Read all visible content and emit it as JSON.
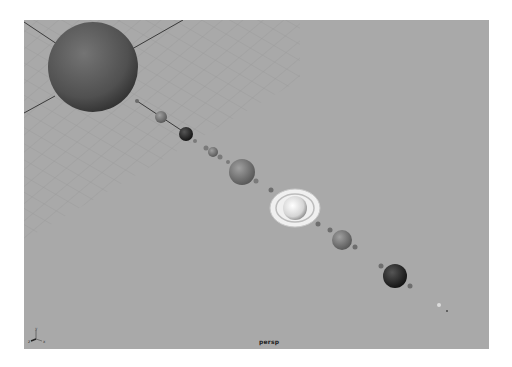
{
  "app": {
    "viewport": {
      "camera_label": "persp",
      "background_color": "#a9a9a9",
      "grid_color": "#8f8f8f",
      "axis_gizmo": {
        "x": "x",
        "y": "y",
        "z": "z"
      }
    }
  },
  "scene": {
    "objects": [
      {
        "name": "sun",
        "cx": 93,
        "cy": 70,
        "r": 45,
        "color": "#5b5b5b"
      },
      {
        "name": "moon-a",
        "cx": 137,
        "cy": 101,
        "r": 2,
        "color": "#6a6a6a"
      },
      {
        "name": "planet-1",
        "cx": 161,
        "cy": 117,
        "r": 6,
        "color": "#6f6f6f"
      },
      {
        "name": "planet-2",
        "cx": 186,
        "cy": 134,
        "r": 7,
        "color": "#1e1e1e"
      },
      {
        "name": "moon-b",
        "cx": 195,
        "cy": 141,
        "r": 2,
        "color": "#7a7a7a"
      },
      {
        "name": "moon-c",
        "cx": 206,
        "cy": 148,
        "r": 2.5,
        "color": "#7a7a7a"
      },
      {
        "name": "planet-3",
        "cx": 213,
        "cy": 152,
        "r": 5,
        "color": "#5e5e5e"
      },
      {
        "name": "moon-d",
        "cx": 220,
        "cy": 157,
        "r": 2.5,
        "color": "#7a7a7a"
      },
      {
        "name": "moon-e",
        "cx": 228,
        "cy": 162,
        "r": 2,
        "color": "#7a7a7a"
      },
      {
        "name": "planet-4",
        "cx": 242,
        "cy": 172,
        "r": 13,
        "color": "#858585"
      },
      {
        "name": "moon-f",
        "cx": 256,
        "cy": 181,
        "r": 2.5,
        "color": "#7a7a7a"
      },
      {
        "name": "moon-g",
        "cx": 271,
        "cy": 190,
        "r": 2.5,
        "color": "#6e6e6e"
      },
      {
        "name": "saturn",
        "cx": 295,
        "cy": 208,
        "r": 12,
        "color": "#e8e8e8"
      },
      {
        "name": "moon-h",
        "cx": 318,
        "cy": 224,
        "r": 2.5,
        "color": "#6e6e6e"
      },
      {
        "name": "moon-i",
        "cx": 330,
        "cy": 230,
        "r": 2.5,
        "color": "#6e6e6e"
      },
      {
        "name": "planet-5",
        "cx": 342,
        "cy": 240,
        "r": 10,
        "color": "#5f5f5f"
      },
      {
        "name": "moon-j",
        "cx": 355,
        "cy": 247,
        "r": 2.5,
        "color": "#6e6e6e"
      },
      {
        "name": "moon-k",
        "cx": 381,
        "cy": 266,
        "r": 2.5,
        "color": "#6e6e6e"
      },
      {
        "name": "planet-6",
        "cx": 395,
        "cy": 276,
        "r": 12,
        "color": "#333333"
      },
      {
        "name": "moon-l",
        "cx": 410,
        "cy": 286,
        "r": 2.5,
        "color": "#6e6e6e"
      },
      {
        "name": "moon-m",
        "cx": 439,
        "cy": 305,
        "r": 2,
        "color": "#dcdcdc"
      },
      {
        "name": "moon-n",
        "cx": 447,
        "cy": 311,
        "r": 1,
        "color": "#4a4a4a"
      }
    ]
  }
}
